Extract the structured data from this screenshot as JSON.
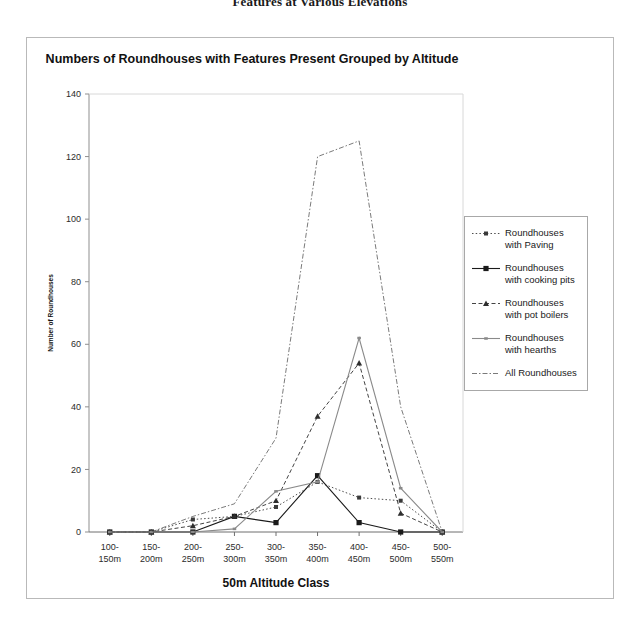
{
  "page": {
    "header_text": "Features at Various Elevations"
  },
  "chart": {
    "title": "Numbers of Roundhouses with Features Present Grouped by Altitude",
    "xlabel": "50m Altitude Class",
    "ylabel": "Number of Roundhouses"
  },
  "legend": {
    "items": [
      {
        "label": "Roundhouses with Paving",
        "style": "dotted",
        "marker": "square",
        "color": "#3a3a3a"
      },
      {
        "label": "Roundhouses with cooking pits",
        "style": "solid",
        "marker": "square",
        "color": "#1a1a1a"
      },
      {
        "label": "Roundhouses with pot boilers",
        "style": "dashed",
        "marker": "triangle",
        "color": "#2e2e2e"
      },
      {
        "label": "Roundhouses with hearths",
        "style": "solid",
        "marker": "tick",
        "color": "#8a8a8a"
      },
      {
        "label": "All Roundhouses",
        "style": "dashdot",
        "marker": "none",
        "color": "#6b6b6b"
      }
    ]
  },
  "chart_data": {
    "type": "line",
    "title": "Numbers of Roundhouses with Features Present Grouped by Altitude",
    "xlabel": "50m Altitude Class",
    "ylabel": "Number of Roundhouses",
    "categories": [
      "100-150m",
      "150-200m",
      "200-250m",
      "250-300m",
      "300-350m",
      "350-400m",
      "400-450m",
      "450-500m",
      "500-550m"
    ],
    "ylim": [
      0,
      140
    ],
    "yticks": [
      0,
      20,
      40,
      60,
      80,
      100,
      120,
      140
    ],
    "grid": false,
    "legend_position": "right",
    "series": [
      {
        "name": "Roundhouses with Paving",
        "values": [
          0,
          0,
          4,
          5,
          8,
          16,
          11,
          10,
          0
        ]
      },
      {
        "name": "Roundhouses with cooking pits",
        "values": [
          0,
          0,
          0,
          5,
          3,
          18,
          3,
          0,
          0
        ]
      },
      {
        "name": "Roundhouses with pot boilers",
        "values": [
          0,
          0,
          2,
          5,
          10,
          37,
          54,
          6,
          0
        ]
      },
      {
        "name": "Roundhouses with hearths",
        "values": [
          0,
          0,
          0,
          1,
          13,
          16,
          62,
          14,
          0
        ]
      },
      {
        "name": "All Roundhouses",
        "values": [
          0,
          0,
          5,
          9,
          30,
          120,
          125,
          40,
          0
        ]
      }
    ]
  }
}
